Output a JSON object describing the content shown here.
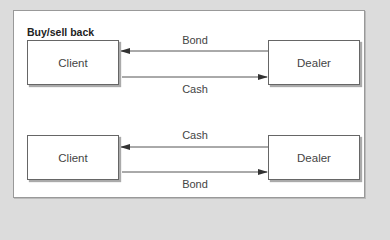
{
  "diagram": {
    "title": "Buy/sell back",
    "legs": [
      {
        "left_party": "Client",
        "right_party": "Dealer",
        "top_flow": {
          "label": "Bond",
          "direction": "right-to-left"
        },
        "bottom_flow": {
          "label": "Cash",
          "direction": "left-to-right"
        }
      },
      {
        "left_party": "Client",
        "right_party": "Dealer",
        "top_flow": {
          "label": "Cash",
          "direction": "right-to-left"
        },
        "bottom_flow": {
          "label": "Bond",
          "direction": "left-to-right"
        }
      }
    ]
  },
  "colors": {
    "background": "#dcdcdc",
    "panel": "#ffffff",
    "line": "#444444"
  }
}
